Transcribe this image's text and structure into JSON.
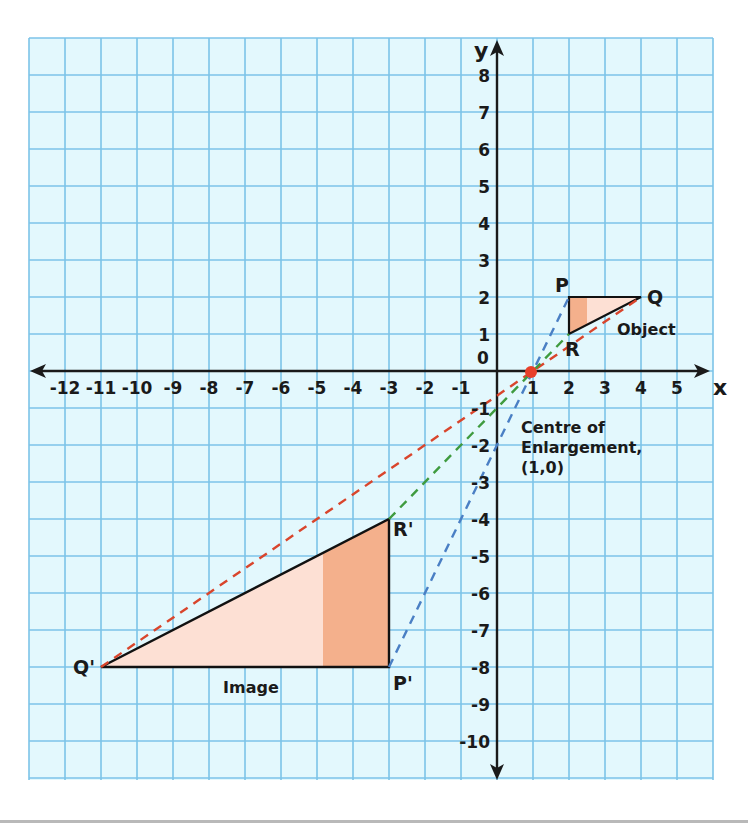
{
  "chart_data": {
    "type": "diagram",
    "grid": true,
    "x_axis": {
      "label": "x",
      "range": [
        -12,
        5
      ],
      "ticks": [
        "-12",
        "-11",
        "-10",
        "-9",
        "-8",
        "-7",
        "-6",
        "-5",
        "-4",
        "-3",
        "-2",
        "-1",
        "1",
        "2",
        "3",
        "4",
        "5"
      ]
    },
    "y_axis": {
      "label": "y",
      "range": [
        -10,
        8
      ],
      "ticks": [
        "8",
        "7",
        "6",
        "5",
        "4",
        "3",
        "2",
        "1",
        "0",
        "-1",
        "-2",
        "-3",
        "-4",
        "-5",
        "-6",
        "-7",
        "-8",
        "-9",
        "-10"
      ]
    },
    "object": {
      "label": "Object",
      "vertices": {
        "P": [
          2,
          2
        ],
        "Q": [
          4,
          2
        ],
        "R": [
          2,
          1
        ]
      }
    },
    "image": {
      "label": "Image",
      "vertices": {
        "P'": [
          -3,
          -8
        ],
        "Q'": [
          -11,
          -8
        ],
        "R'": [
          -3,
          -4
        ]
      }
    },
    "centre_of_enlargement": {
      "label_line1": "Centre of",
      "label_line2": "Enlargement,",
      "label_line3": "(1,0)",
      "point": [
        1,
        0
      ]
    },
    "scale_factor": -4,
    "ray_lines": [
      {
        "from": "Q'",
        "to": "Q",
        "color": "#d9452c",
        "style": "dashed"
      },
      {
        "from": "R'",
        "to": "R",
        "color": "#3f9b3f",
        "style": "dashed"
      },
      {
        "from": "P'",
        "to": "P",
        "color": "#4a7fc4",
        "style": "dashed"
      }
    ]
  },
  "labels": {
    "x_axis": "x",
    "y_axis": "y",
    "P": "P",
    "Q": "Q",
    "R": "R",
    "P_img": "P'",
    "Q_img": "Q'",
    "R_img": "R'",
    "object": "Object",
    "image": "Image",
    "centre_1": "Centre of",
    "centre_2": "Enlargement,",
    "centre_3": "(1,0)",
    "origin": "0"
  },
  "x_ticks": [
    "-12",
    "-11",
    "-10",
    "-9",
    "-8",
    "-7",
    "-6",
    "-5",
    "-4",
    "-3",
    "-2",
    "-1",
    "1",
    "2",
    "3",
    "4",
    "5"
  ],
  "y_ticks_pos": [
    "8",
    "7",
    "6",
    "5",
    "4",
    "3",
    "2",
    "1"
  ],
  "y_ticks_neg": [
    "-1",
    "-2",
    "-3",
    "-4",
    "-5",
    "-6",
    "-7",
    "-8",
    "-9",
    "-10"
  ],
  "colors": {
    "grid_bg": "#e3f8fd",
    "grid_line": "#7cc3e8",
    "axis": "#1a1a1a",
    "triangle_light": "#fde0d4",
    "triangle_dark": "#f4b08c",
    "ray_red": "#d9452c",
    "ray_green": "#3f9b3f",
    "ray_blue": "#4a7fc4",
    "centre_dot": "#e8402a"
  }
}
